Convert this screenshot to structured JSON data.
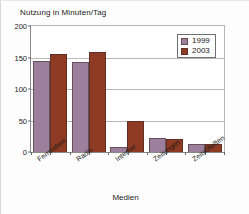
{
  "chart_data": {
    "type": "bar",
    "title": "",
    "subtitle": "",
    "xlabel": "Medien",
    "ylabel": "Nutzung in Minuten/Tag",
    "categories": [
      "Fernsehen",
      "Radio",
      "Internet",
      "Zeitungen",
      "Zeitschriften"
    ],
    "series": [
      {
        "name": "1999",
        "color": "#9c7f9c",
        "values": [
          145,
          143,
          8,
          23,
          13
        ]
      },
      {
        "name": "2003",
        "color": "#8f3a22",
        "values": [
          156,
          158,
          49,
          20,
          13
        ]
      }
    ],
    "ylim": [
      0,
      200
    ],
    "yticks": [
      0,
      50,
      100,
      150,
      200
    ],
    "ytick_labels": [
      "0",
      "50",
      "100",
      "150",
      "200"
    ],
    "grid": true,
    "grid_axis": "y",
    "legend_position": "top-right",
    "legend_entries": [
      "1999",
      "2003"
    ],
    "annotations": []
  },
  "legend": {
    "items": [
      {
        "label": "1999",
        "swatch": "legend-swatch-1999"
      },
      {
        "label": "2003",
        "swatch": "legend-swatch-2003"
      }
    ]
  }
}
